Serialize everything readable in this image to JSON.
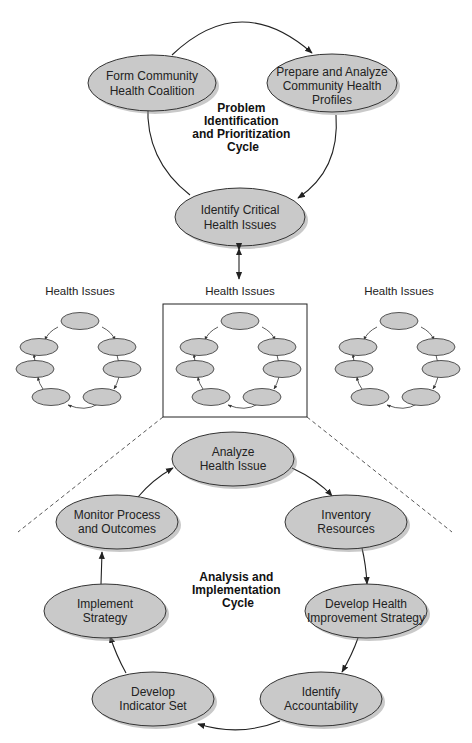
{
  "top_cycle": {
    "title": [
      "Problem",
      "Identification",
      "and Prioritization",
      "Cycle"
    ],
    "nodes": [
      {
        "id": "form-coalition",
        "lines": [
          "Form Community",
          "Health Coalition"
        ]
      },
      {
        "id": "prepare-profiles",
        "lines": [
          "Prepare and Analyze",
          "Community Health",
          "Profiles"
        ]
      },
      {
        "id": "identify-issues",
        "lines": [
          "Identify Critical",
          "Health Issues"
        ]
      }
    ]
  },
  "health_issues": {
    "labels": [
      "Health Issues",
      "Health Issues",
      "Health Issues"
    ]
  },
  "bottom_cycle": {
    "title": [
      "Analysis and",
      "Implementation",
      "Cycle"
    ],
    "nodes": [
      {
        "id": "analyze-issue",
        "lines": [
          "Analyze",
          "Health Issue"
        ]
      },
      {
        "id": "inventory-resources",
        "lines": [
          "Inventory",
          "Resources"
        ]
      },
      {
        "id": "develop-strategy",
        "lines": [
          "Develop Health",
          "Improvement Strategy"
        ]
      },
      {
        "id": "identify-accountability",
        "lines": [
          "Identify",
          "Accountability"
        ]
      },
      {
        "id": "develop-indicator",
        "lines": [
          "Develop",
          "Indicator Set"
        ]
      },
      {
        "id": "implement-strategy",
        "lines": [
          "Implement",
          "Strategy"
        ]
      },
      {
        "id": "monitor-process",
        "lines": [
          "Monitor Process",
          "and Outcomes"
        ]
      }
    ]
  },
  "colors": {
    "node_fill": "#c9c9c9",
    "stroke": "#333333"
  }
}
